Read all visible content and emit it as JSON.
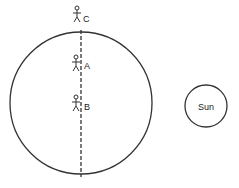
{
  "diagram": {
    "earth": {
      "cx": 81,
      "cy": 103,
      "r": 71
    },
    "axis": {
      "x": 81,
      "y1": 30,
      "y2": 177
    },
    "observers": [
      {
        "label": "C",
        "x": 77,
        "y": 14
      },
      {
        "label": "A",
        "x": 76,
        "y": 63
      },
      {
        "label": "B",
        "x": 76,
        "y": 103
      }
    ],
    "sun": {
      "label": "Sun",
      "cx": 206,
      "cy": 106,
      "r": 21
    }
  }
}
